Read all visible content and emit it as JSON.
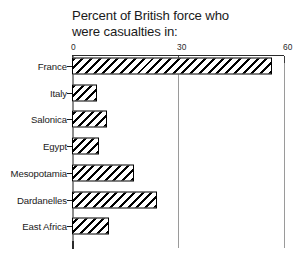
{
  "chart_data": {
    "type": "bar",
    "orientation": "horizontal",
    "title": "Percent of British force who\nwere casualties in:",
    "title_line_1": "Percent of British force who",
    "title_line_2": "were casualties in:",
    "xlabel": "",
    "ylabel": "",
    "xlim": [
      0,
      60
    ],
    "xticks": [
      0,
      30,
      60
    ],
    "xtick_labels": [
      "0",
      "30",
      "60"
    ],
    "grid": true,
    "grid_axis": "x",
    "legend": false,
    "bar_style": {
      "fill": "#ffffff",
      "edge": "#000000",
      "hatch": "diagonal-forward-slash"
    },
    "categories": [
      "France",
      "Italy",
      "Salonica",
      "Egypt",
      "Mesopotamia",
      "Dardanelles",
      "East Africa"
    ],
    "values": [
      56.5,
      7,
      10,
      7.5,
      17.5,
      24,
      10.5
    ],
    "bars": [
      {
        "category": "France",
        "value": 56.5
      },
      {
        "category": "Italy",
        "value": 7
      },
      {
        "category": "Salonica",
        "value": 10
      },
      {
        "category": "Egypt",
        "value": 7.5
      },
      {
        "category": "Mesopotamia",
        "value": 17.5
      },
      {
        "category": "Dardanelles",
        "value": 24
      },
      {
        "category": "East Africa",
        "value": 10.5
      }
    ]
  },
  "colors": {
    "background": "#ffffff",
    "text": "#1a1a1a",
    "axis": "#2b2b2b",
    "gridline": "#9a9a9a",
    "bar_edge": "#000000",
    "bar_fill": "#ffffff"
  }
}
